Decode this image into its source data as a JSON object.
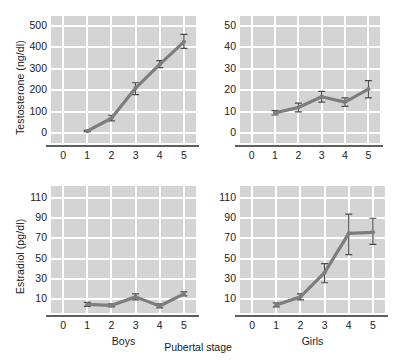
{
  "figure": {
    "xcaption": "Pubertal stage",
    "line_color": "#7d7d7d",
    "panel_bg": "#d4d4d4",
    "grid_color": "#ffffff",
    "axis_color": "#5e5e5e",
    "text_color": "#1b1b1b"
  },
  "chart_data": [
    {
      "type": "line",
      "id": "boys-testosterone",
      "title": "",
      "xlabel": "Boys",
      "ylabel": "Testosterone (ng/dl)",
      "x": [
        1,
        2,
        3,
        4,
        5
      ],
      "xticks": [
        0,
        1,
        2,
        3,
        4,
        5
      ],
      "xlim": [
        -0.5,
        5.5
      ],
      "yticks": [
        0,
        100,
        200,
        300,
        400,
        500
      ],
      "ylim": [
        -45,
        545
      ],
      "values": [
        10,
        70,
        210,
        320,
        425
      ],
      "err_low": [
        8,
        58,
        180,
        305,
        395
      ],
      "err_high": [
        14,
        84,
        235,
        338,
        460
      ],
      "grid": true,
      "legend": "none"
    },
    {
      "type": "line",
      "id": "girls-testosterone",
      "title": "",
      "xlabel": "Girls",
      "ylabel": "Testosterone (ng/dl)",
      "x": [
        1,
        2,
        3,
        4,
        5
      ],
      "xticks": [
        0,
        1,
        2,
        3,
        4,
        5
      ],
      "xlim": [
        -0.5,
        5.5
      ],
      "yticks": [
        0,
        10,
        20,
        30,
        40,
        50
      ],
      "ylim": [
        -4.5,
        54.5
      ],
      "values": [
        9.5,
        12,
        17,
        14.5,
        20.5
      ],
      "err_low": [
        8.5,
        10,
        14.5,
        12.5,
        16.5
      ],
      "err_high": [
        10.5,
        14,
        19.5,
        16.5,
        24.5
      ],
      "grid": true,
      "legend": "none"
    },
    {
      "type": "line",
      "id": "boys-estradiol",
      "title": "",
      "xlabel": "Boys",
      "ylabel": "Estradiol (pg/dl)",
      "x": [
        1,
        2,
        3,
        4,
        5
      ],
      "xticks": [
        0,
        1,
        2,
        3,
        4,
        5
      ],
      "xlim": [
        -0.5,
        5.5
      ],
      "yticks": [
        10,
        30,
        50,
        70,
        90,
        110
      ],
      "ylim": [
        -4,
        122
      ],
      "values": [
        4.5,
        3.5,
        12,
        3,
        15
      ],
      "err_low": [
        2.5,
        2,
        9,
        1,
        13
      ],
      "err_high": [
        6.5,
        5,
        15,
        5,
        17
      ],
      "grid": true,
      "legend": "none"
    },
    {
      "type": "line",
      "id": "girls-estradiol",
      "title": "",
      "xlabel": "Girls",
      "ylabel": "Estradiol (pg/dl)",
      "x": [
        1,
        2,
        3,
        4,
        5
      ],
      "xticks": [
        0,
        1,
        2,
        3,
        4,
        5
      ],
      "xlim": [
        -0.5,
        5.5
      ],
      "yticks": [
        10,
        30,
        50,
        70,
        90,
        110
      ],
      "ylim": [
        -4,
        122
      ],
      "values": [
        4,
        12,
        36,
        75,
        76
      ],
      "err_low": [
        2,
        9,
        26,
        54,
        64
      ],
      "err_high": [
        6,
        15,
        45,
        94,
        90
      ],
      "grid": true,
      "legend": "none"
    }
  ]
}
